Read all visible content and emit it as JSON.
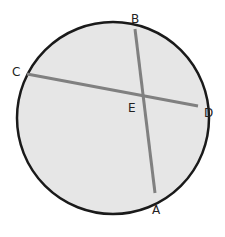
{
  "diagram": {
    "type": "circle-with-intersecting-chords",
    "circle": {
      "cx": 113,
      "cy": 118,
      "r": 96,
      "fill": "#e6e6e6",
      "stroke": "#1a1a1a"
    },
    "chord_color": "#808080",
    "points": {
      "A": {
        "label": "A",
        "x": 155,
        "y": 193,
        "label_x": 152,
        "label_y": 214
      },
      "B": {
        "label": "B",
        "x": 135,
        "y": 29,
        "label_x": 131,
        "label_y": 23
      },
      "C": {
        "label": "C",
        "x": 27,
        "y": 74,
        "label_x": 12,
        "label_y": 76
      },
      "D": {
        "label": "D",
        "x": 198,
        "y": 106,
        "label_x": 204,
        "label_y": 117
      },
      "E": {
        "label": "E",
        "x": 144,
        "y": 95,
        "label_x": 128,
        "label_y": 112
      }
    },
    "chords": [
      {
        "name": "AB",
        "from": "A",
        "to": "B"
      },
      {
        "name": "CD",
        "from": "C",
        "to": "D"
      }
    ]
  }
}
